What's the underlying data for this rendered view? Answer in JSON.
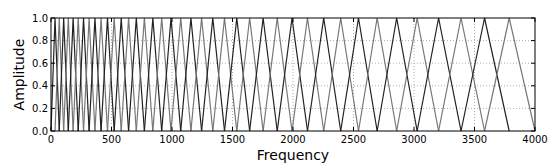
{
  "chart_data": {
    "type": "line",
    "title": "",
    "xlabel": "Frequency",
    "ylabel": "Amplitude",
    "xlim": [
      0,
      4000
    ],
    "ylim": [
      0.0,
      1.0
    ],
    "xticks": [
      0,
      500,
      1000,
      1500,
      2000,
      2500,
      3000,
      3500,
      4000
    ],
    "xtick_labels": [
      "0",
      "500",
      "1000",
      "1500",
      "2000",
      "2500",
      "3000",
      "3500",
      "4000"
    ],
    "yticks": [
      0.0,
      0.2,
      0.4,
      0.6,
      0.8,
      1.0
    ],
    "ytick_labels": [
      "0.0",
      "0.2",
      "0.4",
      "0.6",
      "0.8",
      "1.0"
    ],
    "grid": true,
    "legend": null,
    "filterbank": {
      "n_filters": 40,
      "fmin": 0,
      "fmax": 4000,
      "scale": "mel"
    },
    "series_colors": [
      "#222222",
      "#777777"
    ]
  },
  "layout": {
    "plot": {
      "left": 51,
      "top": 18,
      "right": 535,
      "bottom": 131
    }
  }
}
